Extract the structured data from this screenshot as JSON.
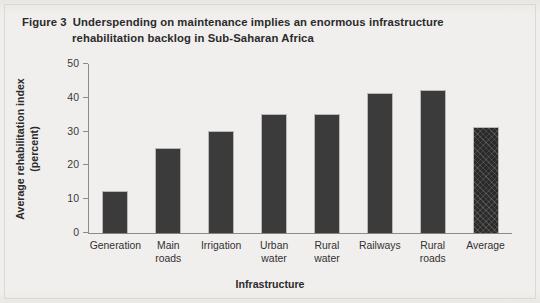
{
  "figure": {
    "label": "Figure 3",
    "title_line1": "Underspending on maintenance implies an enormous infrastructure",
    "title_line2": "rehabilitation backlog in Sub-Saharan Africa",
    "background_color": "#f1efed",
    "bar_color": "#3b3b3b",
    "average_bar_color": "#2a2a2a"
  },
  "chart_data": {
    "type": "bar",
    "xlabel": "Infrastructure",
    "ylabel_line1": "Average rehabilitation index",
    "ylabel_line2": "(percent)",
    "ylabel": "Average rehabilitation index (percent)",
    "categories": [
      "Generation",
      "Main roads",
      "Irrigation",
      "Urban water",
      "Rural water",
      "Railways",
      "Rural roads",
      "Average"
    ],
    "category_lines": [
      [
        "Generation"
      ],
      [
        "Main",
        "roads"
      ],
      [
        "Irrigation"
      ],
      [
        "Urban",
        "water"
      ],
      [
        "Rural",
        "water"
      ],
      [
        "Railways"
      ],
      [
        "Rural",
        "roads"
      ],
      [
        "Average"
      ]
    ],
    "values": [
      12,
      25,
      30,
      35,
      35,
      41,
      42,
      31
    ],
    "ylim": [
      0,
      50
    ],
    "yticks": [
      0,
      10,
      20,
      30,
      40,
      50
    ],
    "ytick_labels": [
      "0",
      "10",
      "20",
      "30",
      "40",
      "50"
    ],
    "grid": false,
    "legend": "none",
    "highlight_last_bar": true,
    "highlight_style": "cross-hatch"
  }
}
